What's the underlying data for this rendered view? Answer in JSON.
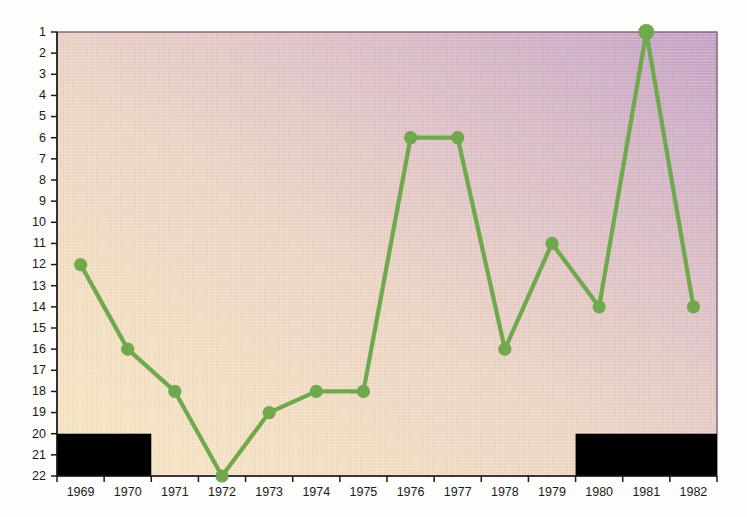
{
  "chart_data": {
    "type": "line",
    "title": "",
    "subtitle": "",
    "xlabel": "",
    "ylabel": "",
    "x": [
      1969,
      1970,
      1971,
      1972,
      1973,
      1974,
      1975,
      1976,
      1977,
      1978,
      1979,
      1980,
      1981,
      1982
    ],
    "categories": [
      "1969",
      "1970",
      "1971",
      "1972",
      "1973",
      "1974",
      "1975",
      "1976",
      "1977",
      "1978",
      "1979",
      "1980",
      "1981",
      "1982"
    ],
    "values": [
      12,
      16,
      18,
      22,
      19,
      18,
      18,
      6,
      6,
      16,
      11,
      14,
      1,
      14
    ],
    "series": [
      {
        "name": "rank",
        "values": [
          12,
          16,
          18,
          22,
          19,
          18,
          18,
          6,
          6,
          16,
          11,
          14,
          1,
          14
        ],
        "color": "#6fa84d",
        "marker": "circle"
      }
    ],
    "y_ticks": [
      1,
      2,
      3,
      4,
      5,
      6,
      7,
      8,
      9,
      10,
      11,
      12,
      13,
      14,
      15,
      16,
      17,
      18,
      19,
      20,
      21,
      22
    ],
    "y_tick_labels": [
      "1",
      "2",
      "3",
      "4",
      "5",
      "6",
      "7",
      "8",
      "9",
      "10",
      "11",
      "12",
      "13",
      "14",
      "15",
      "16",
      "17",
      "18",
      "19",
      "20",
      "21",
      "22"
    ],
    "x_tick_labels": [
      "1969",
      "1970",
      "1971",
      "1972",
      "1973",
      "1974",
      "1975",
      "1976",
      "1977",
      "1978",
      "1979",
      "1980",
      "1981",
      "1982"
    ],
    "ylim": [
      1,
      22
    ],
    "y_axis_inverted": true,
    "xlim": [
      1968.5,
      1982.5
    ],
    "grid": false,
    "legend": false,
    "legend_position": "none",
    "bands": [
      {
        "name": "left-black-band",
        "x_start": 1968.5,
        "x_end": 1970.5,
        "y_start": 20,
        "y_end": 22,
        "color": "#000000"
      },
      {
        "name": "right-black-band",
        "x_start": 1979.5,
        "x_end": 1982.5,
        "y_start": 20,
        "y_end": 22,
        "color": "#000000"
      }
    ],
    "points": [
      {
        "x": "1969",
        "y": 12,
        "emphasis": false
      },
      {
        "x": "1970",
        "y": 16,
        "emphasis": false
      },
      {
        "x": "1971",
        "y": 18,
        "emphasis": false
      },
      {
        "x": "1972",
        "y": 22,
        "emphasis": false
      },
      {
        "x": "1973",
        "y": 19,
        "emphasis": false
      },
      {
        "x": "1974",
        "y": 18,
        "emphasis": false
      },
      {
        "x": "1975",
        "y": 18,
        "emphasis": false
      },
      {
        "x": "1976",
        "y": 6,
        "emphasis": false
      },
      {
        "x": "1977",
        "y": 6,
        "emphasis": false
      },
      {
        "x": "1978",
        "y": 16,
        "emphasis": false
      },
      {
        "x": "1979",
        "y": 11,
        "emphasis": false
      },
      {
        "x": "1980",
        "y": 14,
        "emphasis": false
      },
      {
        "x": "1981",
        "y": 1,
        "emphasis": true
      },
      {
        "x": "1982",
        "y": 14,
        "emphasis": false
      }
    ],
    "background": {
      "gradient_from": "#f7e6c4",
      "gradient_to": "#c7a5c8",
      "border_color": "#8a5a72"
    }
  }
}
